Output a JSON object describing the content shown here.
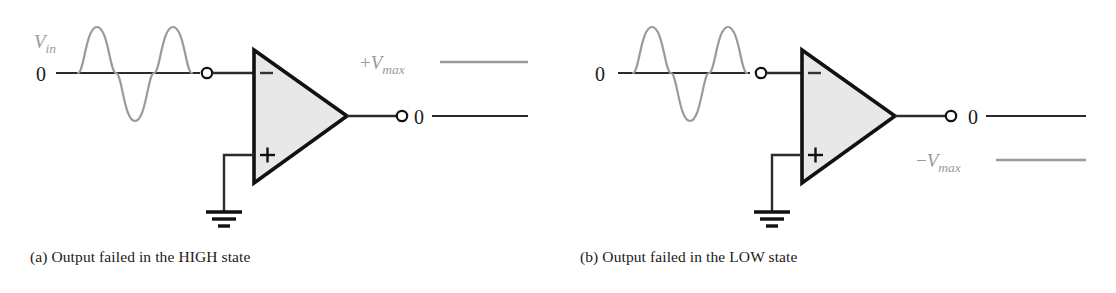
{
  "figure": {
    "colors": {
      "wire": "#2b2b2b",
      "gray": "#9a9a9a",
      "amp_fill": "#e8e8e8",
      "amp_stroke": "#111111",
      "text": "#1a1a1a"
    },
    "panels": [
      {
        "id": "a",
        "caption": "(a) Output failed in the HIGH state",
        "input": {
          "signal_label": "V",
          "signal_sub": "in",
          "baseline_label": "0",
          "waveform": "sine",
          "cycles": 2
        },
        "opamp": {
          "inverting_label": "−",
          "noninverting_label": "+",
          "ground": "ground-symbol"
        },
        "output": {
          "level_label": "+V",
          "level_sub": "max",
          "level_state": "high",
          "baseline_label": "0"
        }
      },
      {
        "id": "b",
        "caption": "(b) Output failed in the LOW state",
        "input": {
          "signal_label": "",
          "signal_sub": "",
          "baseline_label": "0",
          "waveform": "sine",
          "cycles": 2
        },
        "opamp": {
          "inverting_label": "−",
          "noninverting_label": "+",
          "ground": "ground-symbol"
        },
        "output": {
          "level_label": "−V",
          "level_sub": "max",
          "level_state": "low",
          "baseline_label": "0"
        }
      }
    ]
  }
}
